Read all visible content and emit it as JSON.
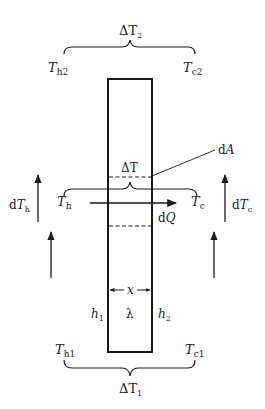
{
  "diagram": {
    "labels": {
      "delta_t2": {
        "sym": "ΔT",
        "sub": "2"
      },
      "delta_t1": {
        "sym": "ΔT",
        "sub": "1"
      },
      "delta_t": "ΔT",
      "th2": {
        "sym": "T",
        "sub": "h2"
      },
      "tc2": {
        "sym": "T",
        "sub": "c2"
      },
      "th1": {
        "sym": "T",
        "sub": "h1"
      },
      "tc1": {
        "sym": "T",
        "sub": "c1"
      },
      "th": {
        "sym": "T",
        "sub": "h"
      },
      "tc": {
        "sym": "T",
        "sub": "c"
      },
      "dth": {
        "pre": "d",
        "sym": "T",
        "sub": "h"
      },
      "dtc": {
        "pre": "d",
        "sym": "T",
        "sub": "c"
      },
      "dq": {
        "pre": "d",
        "sym": "Q"
      },
      "da": {
        "pre": "d",
        "sym": "A"
      },
      "x": "x",
      "lambda": "λ",
      "h1": {
        "sym": "h",
        "sub": "1"
      },
      "h2": {
        "sym": "h",
        "sub": "2"
      }
    },
    "colors": {
      "stroke": "#1a1a1a",
      "background": "#ffffff"
    }
  }
}
